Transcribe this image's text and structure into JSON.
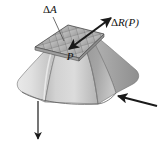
{
  "figure": {
    "type": "engineering-diagram",
    "background_color": "#ffffff",
    "labels": {
      "area_element": {
        "delta": "Δ",
        "symbol": "A",
        "full_text": "ΔA",
        "x": 48,
        "y": 12
      },
      "resultant_force": {
        "delta": "Δ",
        "symbol": "R",
        "argument": "(P)",
        "full_text": "ΔR(P)",
        "x": 112,
        "y": 25
      },
      "point": {
        "symbol": "P",
        "full_text": "P",
        "x": 73,
        "y": 58
      }
    },
    "arrows": [
      {
        "name": "resultant-force-vector",
        "from": [
          68,
          48
        ],
        "to": [
          112,
          18
        ],
        "direction": "up-right",
        "style": "thick-solid",
        "color": "#1a1a1a"
      },
      {
        "name": "point-indicator-arrow",
        "from": [
          112,
          18
        ],
        "to": [
          68,
          48
        ],
        "direction": "down-left",
        "style": "thick-solid",
        "color": "#1a1a1a"
      },
      {
        "name": "bottom-reaction-arrow",
        "from": [
          38,
          100
        ],
        "to": [
          38,
          140
        ],
        "direction": "down",
        "style": "thin-solid",
        "color": "#1a1a1a"
      },
      {
        "name": "side-reaction-arrow",
        "from": [
          155,
          104
        ],
        "to": [
          115,
          95
        ],
        "direction": "left",
        "style": "thick-solid",
        "color": "#1a1a1a"
      }
    ],
    "leader_lines": [
      {
        "name": "delta-a-leader",
        "from": [
          53,
          17
        ],
        "to": [
          64,
          40
        ],
        "color": "#555555"
      }
    ],
    "colors": {
      "top_face_base": "#b6b6b6",
      "top_face_grid_line": "#5c5c5c",
      "left_face_light": "#e2e2e2",
      "left_face_mid": "#cfcfcf",
      "right_face_dark": "#979797",
      "right_face_mid": "#ababab",
      "front_face": "#c4c4c4",
      "outline": "#4a4a4a",
      "arrow": "#1a1a1a",
      "text": "#111111"
    }
  }
}
